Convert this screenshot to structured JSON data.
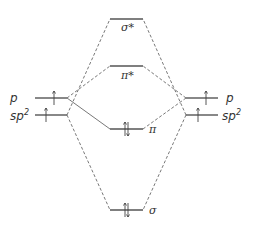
{
  "diagram": {
    "type": "molecular-orbital-diagram",
    "left_atom": {
      "orbitals": [
        {
          "label": "p",
          "electrons": 1
        },
        {
          "label": "sp",
          "sup": "2",
          "electrons": 1
        }
      ]
    },
    "right_atom": {
      "orbitals": [
        {
          "label": "p",
          "electrons": 1
        },
        {
          "label": "sp",
          "sup": "2",
          "electrons": 1
        }
      ]
    },
    "molecular_orbitals": [
      {
        "label": "σ*",
        "electrons": 0
      },
      {
        "label": "π*",
        "electrons": 0
      },
      {
        "label": "π",
        "electrons": 2
      },
      {
        "label": "σ",
        "electrons": 2
      }
    ],
    "colors": {
      "lines": "#555555",
      "text": "#333333",
      "background": "#ffffff"
    }
  }
}
